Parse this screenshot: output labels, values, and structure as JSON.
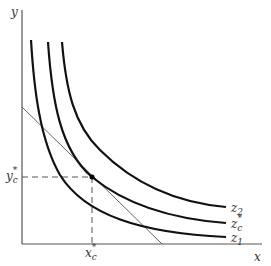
{
  "diagram": {
    "type": "indifference-curves-with-budget-line",
    "axes": {
      "x_label": "x",
      "y_label": "y"
    },
    "curves": [
      {
        "id": "z1",
        "label": "z",
        "subscript": "1",
        "superscript": ""
      },
      {
        "id": "zc",
        "label": "z",
        "subscript": "c",
        "superscript": "*"
      },
      {
        "id": "z2",
        "label": "z",
        "subscript": "2",
        "superscript": ""
      }
    ],
    "budget_line": {
      "description": "straight line tangent to z_c* curve"
    },
    "tangent_point": {
      "x_label": "x",
      "x_subscript": "c",
      "x_superscript": "*",
      "y_label": "y",
      "y_subscript": "c",
      "y_superscript": "*"
    },
    "colors": {
      "axis": "#555555",
      "curve": "#111111",
      "budget_line": "#666666",
      "guide": "#555555"
    }
  }
}
